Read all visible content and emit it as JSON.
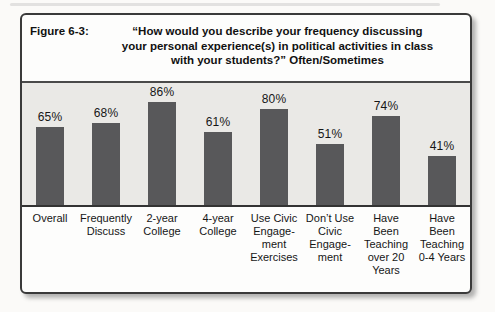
{
  "figure": {
    "label": "Figure 6-3:",
    "title": "“How would you describe your frequency discussing\nyour personal experience(s) in political activities in class\nwith your students?” Often/Sometimes"
  },
  "chart_data": {
    "type": "bar",
    "categories": [
      "Overall",
      "Frequently Discuss",
      "2-year College",
      "4-year College",
      "Use Civic Engagement Exercises",
      "Don't Use Civic Engagement",
      "Have Been Teaching over 20 Years",
      "Have Been Teaching 0-4 Years"
    ],
    "values": [
      65,
      68,
      86,
      61,
      80,
      51,
      74,
      41
    ],
    "value_labels": [
      "65%",
      "68%",
      "86%",
      "61%",
      "80%",
      "51%",
      "74%",
      "41%"
    ],
    "category_display": [
      "Overall",
      "Frequently\nDiscuss",
      "2-year\nCollege",
      "4-year\nCollege",
      "Use Civic\nEngage-\nment\nExercises",
      "Don’t Use\nCivic\nEngage-\nment",
      "Have\nBeen\nTeaching\nover 20\nYears",
      "Have\nBeen\nTeaching\n0-4 Years"
    ],
    "ylim": [
      0,
      100
    ],
    "xlabel": "",
    "ylabel": "",
    "grid": false,
    "legend": false,
    "bar_color": "#58585a",
    "plot_bg": "#eae9e6",
    "axis_color": "#333333"
  }
}
